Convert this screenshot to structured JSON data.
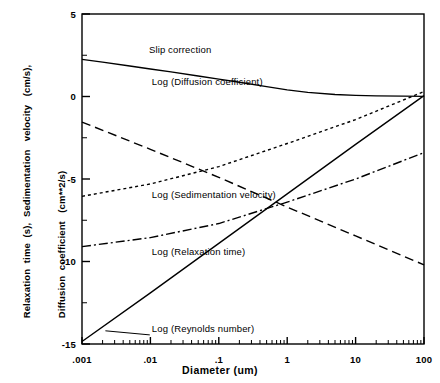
{
  "chart_data": {
    "type": "line",
    "title": "",
    "xlabel": "Diameter   (um)",
    "ylabel_lines": [
      "Slip correction &  Reynolds  number  (dimensionless),",
      "Relaxation  time  (s),  Sedimentation   velocity   (cm/s),",
      "Diffusion  coefficient   (cm**2/s)"
    ],
    "x_scale": "log",
    "xlim": [
      0.001,
      100
    ],
    "ylim": [
      -15,
      5
    ],
    "x_ticks": [
      {
        "value": 0.001,
        "label": ".001"
      },
      {
        "value": 0.01,
        "label": ".01"
      },
      {
        "value": 0.1,
        "label": ".1"
      },
      {
        "value": 1,
        "label": "1"
      },
      {
        "value": 10,
        "label": "10"
      },
      {
        "value": 100,
        "label": "100"
      }
    ],
    "y_ticks": [
      {
        "value": 5,
        "label": "5"
      },
      {
        "value": 0,
        "label": "0"
      },
      {
        "value": -5,
        "label": "-5"
      },
      {
        "value": -10,
        "label": "-10"
      },
      {
        "value": -15,
        "label": "-15"
      }
    ],
    "y_minor_ticks": [
      2.5,
      -2.5,
      -7.5,
      -12.5
    ],
    "grid": false,
    "legend_position": "inline-annotations",
    "series": [
      {
        "name": "Slip correction",
        "label": "Slip correction",
        "style": "solid",
        "color": "#000000",
        "x": [
          0.001,
          0.002,
          0.005,
          0.01,
          0.02,
          0.05,
          0.1,
          0.2,
          0.5,
          1,
          2,
          5,
          10,
          20,
          50,
          100
        ],
        "y": [
          2.25,
          2.08,
          1.85,
          1.67,
          1.49,
          1.24,
          1.05,
          0.86,
          0.6,
          0.4,
          0.25,
          0.12,
          0.07,
          0.04,
          0.02,
          0.01
        ],
        "label_x": 0.0095,
        "label_y": 2.65
      },
      {
        "name": "Log (Diffusion coefficient)",
        "label": "Log (Diffusion coefficient)",
        "style": "dashed",
        "color": "#000000",
        "x": [
          0.001,
          0.01,
          0.1,
          1,
          10,
          100
        ],
        "y": [
          -1.55,
          -3.2,
          -4.9,
          -6.7,
          -8.45,
          -10.2
        ],
        "label_x": 0.0105,
        "label_y": 0.7
      },
      {
        "name": "Log (Sedimentation velocity)",
        "label": "Log (Sedimentation velocity)",
        "style": "dotted",
        "color": "#000000",
        "x": [
          0.001,
          0.01,
          0.1,
          1,
          10,
          100
        ],
        "y": [
          -6.05,
          -5.3,
          -4.25,
          -2.85,
          -1.4,
          0.3
        ],
        "label_x": 0.0105,
        "label_y": -6.15
      },
      {
        "name": "Log (Relaxation time)",
        "label": "Log (Relaxation time)",
        "style": "dashdot",
        "color": "#000000",
        "x": [
          0.001,
          0.01,
          0.1,
          1,
          10,
          100
        ],
        "y": [
          -9.1,
          -8.55,
          -7.7,
          -6.4,
          -5.0,
          -3.4
        ],
        "label_x": 0.0105,
        "label_y": -9.6
      },
      {
        "name": "Log (Reynolds number)",
        "label": "Log (Reynolds number)",
        "style": "solid",
        "color": "#000000",
        "x": [
          0.001,
          0.01,
          0.1,
          1,
          10,
          100
        ],
        "y": [
          -14.85,
          -11.9,
          -8.9,
          -5.9,
          -2.9,
          0.05
        ],
        "label_x": 0.0105,
        "label_y": -14.3
      }
    ],
    "annotations": [
      {
        "name": "reynolds-leader-line",
        "from": {
          "x": 0.0022,
          "y": -14.2
        },
        "to": {
          "x": 0.0098,
          "y": -14.45
        }
      }
    ]
  }
}
